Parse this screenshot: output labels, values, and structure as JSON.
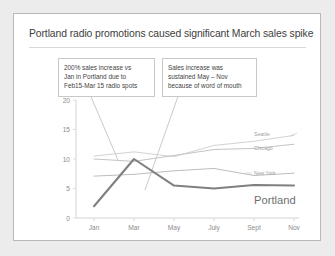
{
  "slide": {
    "title": "Portland radio promotions caused significant March sales spike"
  },
  "callouts": [
    {
      "id": "callout-1",
      "lines": [
        "200% sales increase vs",
        "Jan in Portland due to",
        "Feb15-Mar 15 radio spots"
      ]
    },
    {
      "id": "callout-2",
      "lines": [
        "Sales increase was",
        "sustained May – Nov",
        "because of word of mouth"
      ]
    }
  ],
  "chart_data": {
    "type": "line",
    "title": "Portland radio promotions caused significant March sales spike",
    "xlabel": "",
    "ylabel": "",
    "categories": [
      "Jan",
      "Mar",
      "May",
      "July",
      "Sept",
      "Nov"
    ],
    "ylim": [
      0,
      20
    ],
    "yticks": [
      0,
      5,
      10,
      15,
      20
    ],
    "grid": false,
    "legend_position": "right-inline",
    "series": [
      {
        "name": "Seattle",
        "color": "#d3d3d3",
        "highlight": false,
        "values": [
          10.5,
          11.2,
          10.4,
          12.3,
          13.0,
          14.0
        ]
      },
      {
        "name": "Chicago",
        "color": "#c4c4c4",
        "highlight": false,
        "values": [
          10.0,
          9.6,
          10.6,
          11.6,
          11.8,
          12.5
        ]
      },
      {
        "name": "New York",
        "color": "#bdbdbd",
        "highlight": false,
        "values": [
          7.1,
          7.4,
          8.0,
          8.4,
          7.2,
          7.6
        ]
      },
      {
        "name": "Portland",
        "color": "#808080",
        "highlight": true,
        "values": [
          2.0,
          10.0,
          5.5,
          5.0,
          5.6,
          5.5
        ]
      }
    ]
  }
}
